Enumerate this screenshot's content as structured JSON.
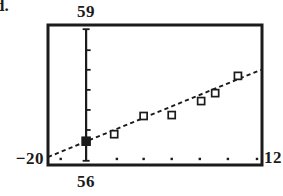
{
  "figure_label": "d.",
  "colors": {
    "background": "#ffffff",
    "ink": "#1b1b1b"
  },
  "chart_data": {
    "type": "scatter",
    "title": "",
    "marker_style": "open-square",
    "grid": false,
    "legend": false,
    "window": {
      "xmin": -20,
      "xmax": 12,
      "ymin": 56,
      "ymax": 59
    },
    "window_labels": {
      "top": "59",
      "bottom": "56",
      "left": "−20",
      "right": "12"
    },
    "points": [
      {
        "x": -10.1,
        "y": 56.66
      },
      {
        "x": -5.7,
        "y": 57.05
      },
      {
        "x": -1.5,
        "y": 57.07
      },
      {
        "x": 2.9,
        "y": 57.37
      },
      {
        "x": 5.0,
        "y": 57.54
      },
      {
        "x": 8.4,
        "y": 57.91
      }
    ],
    "highlighted_point": {
      "x": -14.3,
      "y": 56.51,
      "style": "filled-square"
    },
    "trendline": {
      "style": "dashed",
      "x1": -20,
      "y1": 56.17,
      "x2": 11.85,
      "y2": 58.04
    },
    "y_axis": {
      "x": -14.3,
      "y_top": 58.91,
      "y_bottom": 56.09,
      "tick_ys": [
        58.46,
        58.04,
        57.61,
        57.18,
        56.75
      ]
    },
    "x_tick_dots_x": [
      -18.1,
      -9.7,
      -5.7,
      -1.5,
      2.7,
      6.9,
      11.25
    ],
    "x_tick_dots_y": 56.13
  }
}
